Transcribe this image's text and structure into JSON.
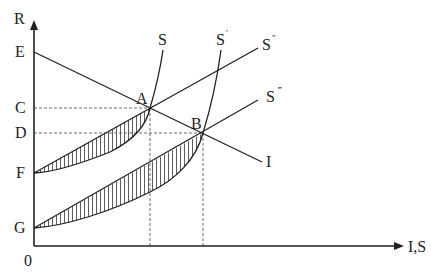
{
  "diagram": {
    "type": "economics-investment-saving",
    "axes": {
      "y_label": "R",
      "x_label": "I,S",
      "origin_label": "0"
    },
    "y_axis_points": [
      {
        "label": "E",
        "y": 52
      },
      {
        "label": "C",
        "y": 108
      },
      {
        "label": "D",
        "y": 133
      },
      {
        "label": "F",
        "y": 173
      },
      {
        "label": "G",
        "y": 228
      }
    ],
    "intersections": [
      {
        "label": "A",
        "x": 150,
        "y": 108
      },
      {
        "label": "B",
        "x": 203,
        "y": 133
      }
    ],
    "curves": {
      "S": {
        "label": "S",
        "prime": ""
      },
      "S_prime": {
        "label": "S",
        "prime": "′"
      },
      "S_double": {
        "label": "S",
        "prime": "″"
      },
      "S_triple": {
        "label": "S",
        "prime": "‴"
      },
      "I": {
        "label": "I"
      }
    },
    "colors": {
      "line": "#222222",
      "dashed": "#444444",
      "hatch": "#333333",
      "background": "#ffffff"
    }
  }
}
